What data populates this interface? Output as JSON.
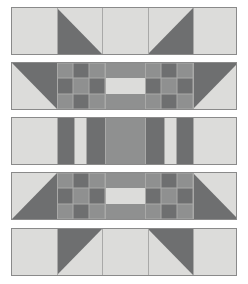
{
  "artwork": {
    "title": "Quilt Block Strip Pattern",
    "kind": "pieced-quilt-diagram",
    "canvas": {
      "width": 248,
      "height": 284,
      "background": "#ffffff"
    }
  },
  "palette": {
    "light": "#dcdcda",
    "medium": "#8f9090",
    "dark": "#6e6f70",
    "border": "#8a8a8a",
    "seam": "#a9a9a8",
    "background": "#ffffff"
  },
  "layout": {
    "strip_left": 11,
    "strip_width": 226,
    "strip_height": 48,
    "strip_tops": [
      7,
      62,
      117,
      172,
      228
    ],
    "gap": 7
  },
  "rows": [
    {
      "name": "row-1-flying-geese-top",
      "index": 1,
      "label": "Row 1",
      "type": "half-square-triangle-strip",
      "top": 7,
      "height": 48,
      "cells": [
        {
          "name": "cell-plain-left",
          "x": 0,
          "w": 45,
          "fill": "light",
          "shape": "square"
        },
        {
          "name": "cell-hst-1",
          "x": 45,
          "w": 45,
          "fill": "light",
          "shape": "triangle",
          "corner": "bottom-left",
          "tri_fill": "dark"
        },
        {
          "name": "cell-plain-center",
          "x": 90,
          "w": 46,
          "fill": "light",
          "shape": "square"
        },
        {
          "name": "cell-hst-2",
          "x": 136,
          "w": 45,
          "fill": "light",
          "shape": "triangle",
          "corner": "bottom-right",
          "tri_fill": "dark"
        },
        {
          "name": "cell-plain-right",
          "x": 181,
          "w": 45,
          "fill": "light",
          "shape": "square"
        }
      ]
    },
    {
      "name": "row-2-checkerboard-upper",
      "index": 2,
      "label": "Row 2",
      "type": "checkerboard-strip",
      "top": 62,
      "height": 48,
      "corner_left": {
        "name": "corner-tri-left",
        "x": 0,
        "w": 45,
        "base": "light",
        "tri_fill": "dark",
        "corner": "top-right"
      },
      "corner_right": {
        "name": "corner-tri-right",
        "x": 181,
        "w": 45,
        "base": "light",
        "tri_fill": "dark",
        "corner": "top-left"
      },
      "checker_left": {
        "name": "checkerboard-left",
        "x": 45,
        "w": 48,
        "cols": 3,
        "rows": 3,
        "grid": [
          [
            "medium",
            "dark",
            "medium"
          ],
          [
            "dark",
            "medium",
            "dark"
          ],
          [
            "medium",
            "dark",
            "medium"
          ]
        ]
      },
      "checker_right": {
        "name": "checkerboard-right",
        "x": 133,
        "w": 48,
        "cols": 3,
        "rows": 3,
        "grid": [
          [
            "medium",
            "dark",
            "medium"
          ],
          [
            "dark",
            "medium",
            "dark"
          ],
          [
            "medium",
            "dark",
            "medium"
          ]
        ]
      },
      "center": {
        "name": "center-bar-block",
        "x": 93,
        "w": 40,
        "fill": "medium",
        "bar": {
          "name": "center-light-bar",
          "fill": "light",
          "top_pct": 33,
          "height_pct": 34
        }
      }
    },
    {
      "name": "row-3-vertical-bars",
      "index": 3,
      "label": "Row 3",
      "type": "vertical-bar-strip",
      "top": 117,
      "height": 48,
      "bars": [
        {
          "name": "bar-light-outer-left",
          "x": 0,
          "w": 45,
          "fill": "light"
        },
        {
          "name": "bar-dark-left-1",
          "x": 45,
          "w": 17,
          "fill": "dark"
        },
        {
          "name": "bar-light-narrow-left",
          "x": 62,
          "w": 12,
          "fill": "light"
        },
        {
          "name": "bar-dark-left-2",
          "x": 74,
          "w": 19,
          "fill": "dark"
        },
        {
          "name": "bar-center-medium",
          "x": 93,
          "w": 40,
          "fill": "medium"
        },
        {
          "name": "bar-dark-right-2",
          "x": 133,
          "w": 19,
          "fill": "dark"
        },
        {
          "name": "bar-light-narrow-right",
          "x": 152,
          "w": 12,
          "fill": "light"
        },
        {
          "name": "bar-dark-right-1",
          "x": 164,
          "w": 17,
          "fill": "dark"
        },
        {
          "name": "bar-light-outer-right",
          "x": 181,
          "w": 45,
          "fill": "light"
        }
      ]
    },
    {
      "name": "row-4-checkerboard-lower",
      "index": 4,
      "label": "Row 4",
      "type": "checkerboard-strip",
      "top": 172,
      "height": 48,
      "corner_left": {
        "name": "corner-tri-left",
        "x": 0,
        "w": 45,
        "base": "light",
        "tri_fill": "dark",
        "corner": "bottom-right"
      },
      "corner_right": {
        "name": "corner-tri-right",
        "x": 181,
        "w": 45,
        "base": "light",
        "tri_fill": "dark",
        "corner": "bottom-left"
      },
      "checker_left": {
        "name": "checkerboard-left",
        "x": 45,
        "w": 48,
        "cols": 3,
        "rows": 3,
        "grid": [
          [
            "medium",
            "dark",
            "medium"
          ],
          [
            "dark",
            "medium",
            "dark"
          ],
          [
            "medium",
            "dark",
            "medium"
          ]
        ]
      },
      "checker_right": {
        "name": "checkerboard-right",
        "x": 133,
        "w": 48,
        "cols": 3,
        "rows": 3,
        "grid": [
          [
            "medium",
            "dark",
            "medium"
          ],
          [
            "dark",
            "medium",
            "dark"
          ],
          [
            "medium",
            "dark",
            "medium"
          ]
        ]
      },
      "center": {
        "name": "center-bar-block",
        "x": 93,
        "w": 40,
        "fill": "medium",
        "bar": {
          "name": "center-light-bar",
          "fill": "light",
          "top_pct": 33,
          "height_pct": 34
        }
      }
    },
    {
      "name": "row-5-flying-geese-bottom",
      "index": 5,
      "label": "Row 5",
      "type": "half-square-triangle-strip",
      "top": 228,
      "height": 48,
      "cells": [
        {
          "name": "cell-plain-left",
          "x": 0,
          "w": 45,
          "fill": "light",
          "shape": "square"
        },
        {
          "name": "cell-hst-1",
          "x": 45,
          "w": 45,
          "fill": "light",
          "shape": "triangle",
          "corner": "top-left",
          "tri_fill": "dark"
        },
        {
          "name": "cell-plain-center",
          "x": 90,
          "w": 46,
          "fill": "light",
          "shape": "square"
        },
        {
          "name": "cell-hst-2",
          "x": 136,
          "w": 45,
          "fill": "light",
          "shape": "triangle",
          "corner": "top-right",
          "tri_fill": "dark"
        },
        {
          "name": "cell-plain-right",
          "x": 181,
          "w": 45,
          "fill": "light",
          "shape": "square"
        }
      ]
    }
  ]
}
